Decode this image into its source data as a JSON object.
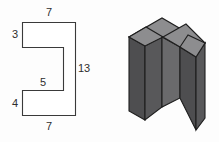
{
  "figure": {
    "background_color": "#fdfdfd",
    "line_color": "#3a3a3a",
    "text_color": "#2e2e2e",
    "solid_front_color": "#58585a",
    "solid_side_color": "#4e4e50",
    "solid_top_color": "#8d8d8f",
    "solid_inner_color": "#6a6a6c"
  },
  "orthographic_view": {
    "shape_name": "c-shaped-cross-section",
    "dimensions": {
      "top_width": "7",
      "upper_left_height": "3",
      "notch_depth": "5",
      "overall_height": "13",
      "lower_left_height": "4",
      "bottom_width": "7"
    }
  },
  "isometric_view": {
    "shape_name": "c-shaped-extruded-solid"
  }
}
